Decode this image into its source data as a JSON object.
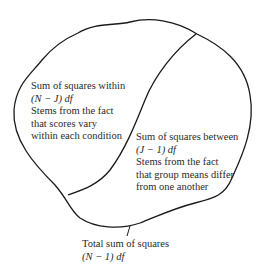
{
  "diagram": {
    "regions": {
      "within": {
        "title": "Sum of squares within",
        "df": "(N − J) df",
        "desc_lines": [
          "Stems from the fact",
          "that scores vary",
          "within each condition"
        ]
      },
      "between": {
        "title": "Sum of squares between",
        "df": "(J − 1) df",
        "desc_lines": [
          "Stems from the fact",
          "that group means differ",
          "from one another"
        ]
      }
    },
    "total": {
      "title": "Total sum of squares",
      "df": "(N − 1) df"
    },
    "colors": {
      "stroke": "#1a1a1a",
      "text": "#2a2a2a",
      "background": "#ffffff"
    }
  }
}
